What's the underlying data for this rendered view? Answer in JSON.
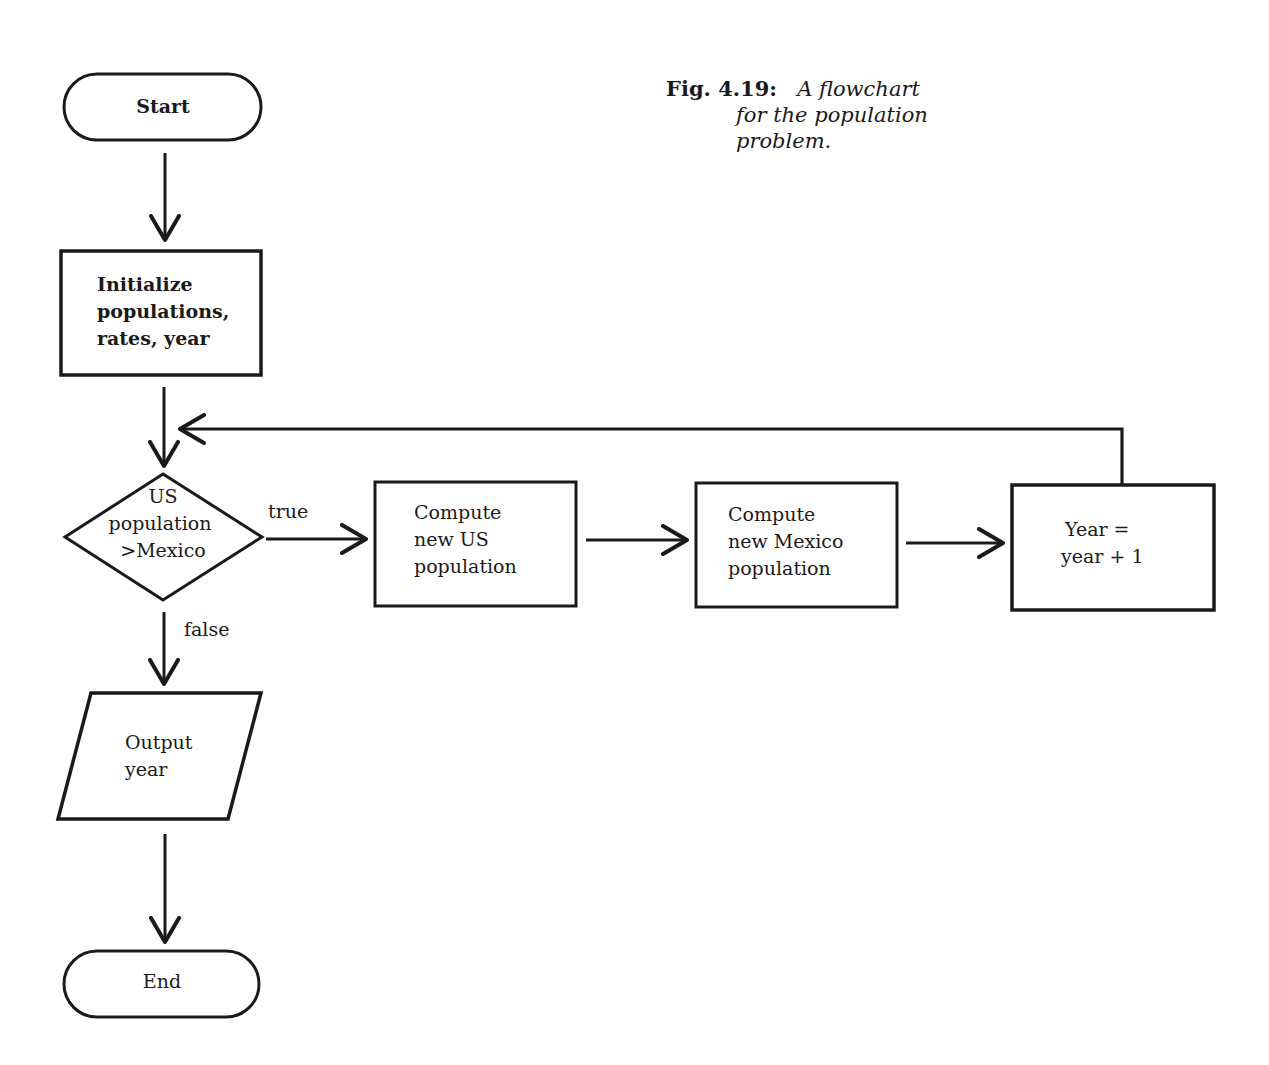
{
  "caption": {
    "figure_number": "Fig. 4.19:",
    "line1": "A flowchart",
    "line2": "for the population",
    "line3": "problem."
  },
  "nodes": {
    "start": {
      "type": "terminal",
      "lines": [
        "Start"
      ]
    },
    "initialize": {
      "type": "process",
      "lines": [
        "Initialize",
        "populations,",
        "rates, year"
      ]
    },
    "decision": {
      "type": "decision",
      "lines": [
        "US",
        "population",
        ">Mexico"
      ]
    },
    "compute_us": {
      "type": "process",
      "lines": [
        "Compute",
        "new US",
        "population"
      ]
    },
    "compute_mexico": {
      "type": "process",
      "lines": [
        "Compute",
        "new Mexico",
        "population"
      ]
    },
    "increment_year": {
      "type": "process",
      "lines": [
        "Year =",
        "year + 1"
      ]
    },
    "output": {
      "type": "input-output",
      "lines": [
        "Output",
        "year"
      ]
    },
    "end": {
      "type": "terminal",
      "lines": [
        "End"
      ]
    }
  },
  "edges": {
    "true_label": "true",
    "false_label": "false"
  },
  "colors": {
    "stroke": "#1a1a1a",
    "background": "#ffffff"
  }
}
